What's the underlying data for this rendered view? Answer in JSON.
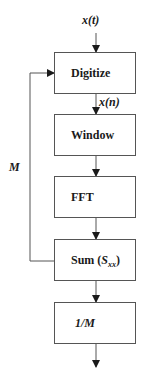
{
  "diagram": {
    "input_signal": "x(t)",
    "sampled_signal": "x(n)",
    "feedback_label": "M",
    "blocks": [
      {
        "id": "digitize",
        "label": "Digitize"
      },
      {
        "id": "window",
        "label": "Window"
      },
      {
        "id": "fft",
        "label": "FFT"
      },
      {
        "id": "sum",
        "label_main": "Sum (",
        "label_sym": "S",
        "label_sub": "xx",
        "label_end": ")"
      },
      {
        "id": "scale",
        "label_num": "1/",
        "label_var": "M"
      }
    ],
    "colors": {
      "line": "#555555",
      "arrow": "#1a1a1a",
      "text": "#1a1a1a"
    }
  }
}
